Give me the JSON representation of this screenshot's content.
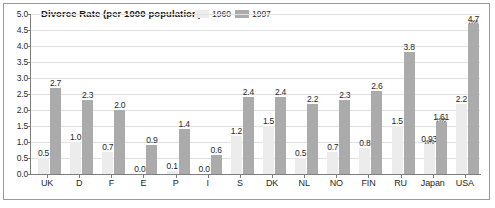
{
  "chart_data": {
    "type": "bar",
    "title": "Divorce Rate (per 1000 population)",
    "xlabel": "",
    "ylabel": "",
    "ylim": [
      0.0,
      5.0
    ],
    "ytick_labels": [
      "5.0",
      "4.5",
      "4.0",
      "3.5",
      "3.0",
      "2.5",
      "2.0",
      "1.5",
      "1.0",
      "0.5",
      "0.0"
    ],
    "ytick_values": [
      5.0,
      4.5,
      4.0,
      3.5,
      3.0,
      2.5,
      2.0,
      1.5,
      1.0,
      0.5,
      0.0
    ],
    "grid": true,
    "legend_position": "top-right",
    "categories": [
      "UK",
      "D",
      "F",
      "E",
      "P",
      "I",
      "S",
      "DK",
      "NL",
      "NO",
      "FIN",
      "RU",
      "Japan",
      "USA"
    ],
    "series": [
      {
        "name": "1960",
        "color": "#ececec",
        "values": [
          0.5,
          1.0,
          0.7,
          0.0,
          0.1,
          0.0,
          1.2,
          1.5,
          0.5,
          0.7,
          0.8,
          1.5,
          0.93,
          2.2
        ],
        "labels": [
          "0.5",
          "1.0",
          "0.7",
          "0.0",
          "0.1",
          "0.0",
          "1.2",
          "1.5",
          "0.5",
          "0.7",
          "0.8",
          "1.5",
          "0.93",
          "2.2"
        ],
        "notes": [
          "",
          "",
          "",
          "",
          "",
          "",
          "",
          "",
          "",
          "",
          "",
          "",
          "1970",
          ""
        ]
      },
      {
        "name": "1997",
        "color": "#ababab",
        "values": [
          2.7,
          2.3,
          2.0,
          0.9,
          1.4,
          0.6,
          2.4,
          2.4,
          2.2,
          2.3,
          2.6,
          3.8,
          1.61,
          4.7
        ],
        "labels": [
          "2.7",
          "2.3",
          "2.0",
          "0.9",
          "1.4",
          "0.6",
          "2.4",
          "2.4",
          "2.2",
          "2.3",
          "2.6",
          "3.8",
          "1.61",
          "4.7"
        ],
        "notes": [
          "",
          "",
          "",
          "",
          "",
          "",
          "",
          "",
          "",
          "",
          "",
          "",
          "1995",
          "1996"
        ]
      }
    ]
  },
  "legend": {
    "items": [
      {
        "label": "1960",
        "color": "#ececec"
      },
      {
        "label": "1997",
        "color": "#ababab"
      }
    ]
  },
  "colors": {
    "series_1960": "#ececec",
    "series_1997": "#ababab",
    "axis": "#7d7d7d",
    "grid": "#e2e2e2",
    "frame": "#9a9a9a",
    "text": "#1f1f1f",
    "background": "#ffffff"
  }
}
